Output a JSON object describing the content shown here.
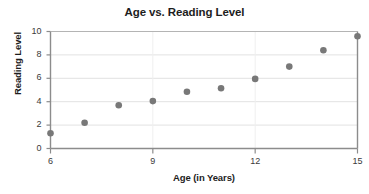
{
  "chart_data": {
    "type": "scatter",
    "title": "Age vs. Reading Level",
    "xlabel": "Age (in Years)",
    "ylabel": "Reading Level",
    "xlim": [
      6,
      15
    ],
    "ylim": [
      0,
      10
    ],
    "grid": true,
    "legend": "none",
    "xticks": [
      6,
      9,
      12,
      15
    ],
    "xtick_labels": [
      "6",
      "9",
      "12",
      "15"
    ],
    "yticks": [
      0,
      2,
      4,
      6,
      8,
      10
    ],
    "ytick_labels": [
      "0",
      "2",
      "4",
      "6",
      "8",
      "10"
    ],
    "x": [
      6,
      7,
      8,
      9,
      10,
      11,
      12,
      13,
      14,
      15
    ],
    "y": [
      1.3,
      2.2,
      3.7,
      4.05,
      4.85,
      5.15,
      5.95,
      7.0,
      8.4,
      9.6
    ],
    "points": [
      {
        "x": 6,
        "y": 1.3
      },
      {
        "x": 7,
        "y": 2.2
      },
      {
        "x": 8,
        "y": 3.7
      },
      {
        "x": 9,
        "y": 4.05
      },
      {
        "x": 10,
        "y": 4.85
      },
      {
        "x": 11,
        "y": 5.15
      },
      {
        "x": 12,
        "y": 5.95
      },
      {
        "x": 13,
        "y": 7.0
      },
      {
        "x": 14,
        "y": 8.4
      },
      {
        "x": 15,
        "y": 9.6
      }
    ],
    "marker_color": "#787878",
    "axis_color": "#8c8c8c",
    "grid_color": "#e2e2e2",
    "text_color": "#1d1d1d"
  }
}
